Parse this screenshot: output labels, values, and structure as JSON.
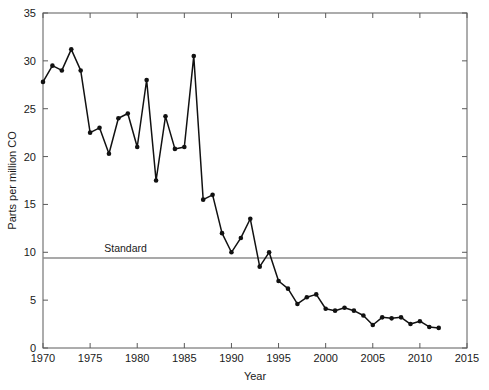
{
  "chart_data": {
    "type": "line",
    "title": "",
    "xlabel": "Year",
    "ylabel": "Parts per million CO",
    "xlim": [
      1970,
      2015
    ],
    "ylim": [
      0,
      35
    ],
    "xticks": [
      1970,
      1975,
      1980,
      1985,
      1990,
      1995,
      2000,
      2005,
      2010,
      2015
    ],
    "xticklabels": [
      "1970",
      "1975",
      "1980",
      "1985",
      "1990",
      "1995",
      "2000",
      "2005",
      "2010",
      "2015"
    ],
    "yticks": [
      0,
      5,
      10,
      15,
      20,
      25,
      30,
      35
    ],
    "yticklabels": [
      "0",
      "5",
      "10",
      "15",
      "20",
      "25",
      "30",
      "35"
    ],
    "grid": false,
    "legend": false,
    "marker": "filled-circle",
    "line_color": "#111111",
    "annotations": [
      {
        "name": "standard-line",
        "kind": "horizontal-reference-line",
        "label": "Standard",
        "value": 9.4,
        "color": "#8c8c8c",
        "label_x": 1976.5
      }
    ],
    "series": [
      {
        "name": "CO concentration",
        "x": [
          1970,
          1971,
          1972,
          1973,
          1974,
          1975,
          1976,
          1977,
          1978,
          1979,
          1980,
          1981,
          1982,
          1983,
          1984,
          1985,
          1986,
          1987,
          1988,
          1989,
          1990,
          1991,
          1992,
          1993,
          1994,
          1995,
          1996,
          1997,
          1998,
          1999,
          2000,
          2001,
          2002,
          2003,
          2004,
          2005,
          2006,
          2007,
          2008,
          2009,
          2010,
          2011,
          2012
        ],
        "y": [
          27.8,
          29.5,
          29.0,
          31.2,
          29.0,
          22.5,
          23.0,
          20.3,
          24.0,
          24.5,
          21.0,
          28.0,
          17.5,
          24.2,
          20.8,
          21.0,
          30.5,
          15.5,
          16.0,
          12.0,
          10.0,
          11.5,
          13.5,
          8.5,
          10.0,
          7.0,
          6.2,
          4.6,
          5.3,
          5.6,
          4.1,
          3.9,
          4.2,
          3.9,
          3.4,
          2.4,
          3.2,
          3.1,
          3.2,
          2.5,
          2.8,
          2.2,
          2.1
        ]
      }
    ]
  },
  "axes": {
    "x_title": "Year",
    "y_title": "Parts per million CO"
  }
}
